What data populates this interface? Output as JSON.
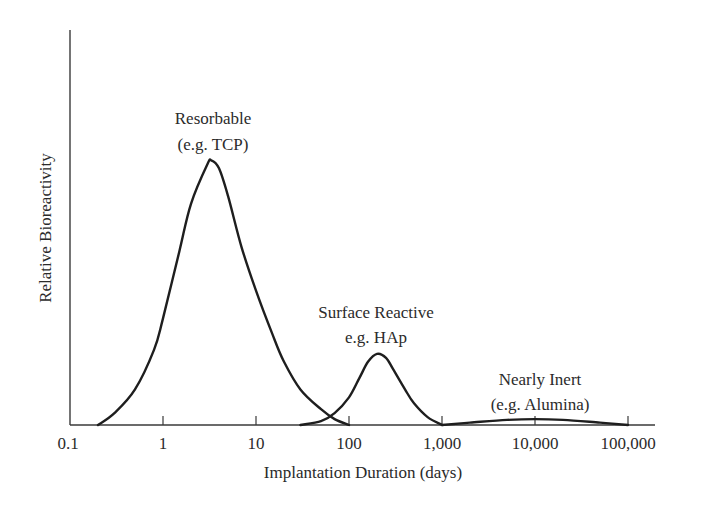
{
  "chart_data": {
    "type": "line",
    "title": "",
    "xlabel": "Implantation Duration (days)",
    "ylabel": "Relative Bioreactivity",
    "xscale": "log",
    "xlim": [
      0.1,
      100000
    ],
    "ylim": [
      0,
      100
    ],
    "grid": false,
    "legend": "none (curves annotated directly)",
    "x_ticks": [
      0.1,
      1,
      10,
      100,
      1000,
      10000,
      100000
    ],
    "x_tick_labels": [
      "0.1",
      "1",
      "10",
      "100",
      "1,000",
      "10,000",
      "100,000"
    ],
    "y_ticks": [],
    "series": [
      {
        "name": "Resorbable",
        "annotation": [
          "Resorbable",
          "(e.g. TCP)"
        ],
        "x": [
          0.2,
          0.3,
          0.5,
          0.8,
          1,
          1.5,
          2,
          3,
          3.3,
          4,
          5,
          7,
          10,
          15,
          20,
          30,
          50,
          70,
          100
        ],
        "values": [
          0,
          3,
          9,
          19,
          27,
          44,
          56,
          66,
          67,
          65,
          58,
          45,
          34,
          23,
          16,
          9,
          4,
          1.5,
          0
        ]
      },
      {
        "name": "Surface Reactive",
        "annotation": [
          "Surface Reactive",
          "e.g. HAp"
        ],
        "x": [
          30,
          50,
          70,
          100,
          130,
          160,
          200,
          250,
          300,
          400,
          500,
          700,
          1000
        ],
        "values": [
          0,
          1,
          3,
          7,
          12,
          16,
          18,
          17,
          14,
          9,
          5.5,
          2,
          0
        ]
      },
      {
        "name": "Nearly Inert",
        "annotation": [
          "Nearly Inert",
          "(e.g. Alumina)"
        ],
        "x": [
          1000,
          2000,
          5000,
          10000,
          20000,
          50000,
          100000
        ],
        "values": [
          0,
          0.6,
          1.3,
          1.5,
          1.3,
          0.6,
          0
        ]
      }
    ]
  },
  "axes": {
    "xlabel": "Implantation Duration (days)",
    "ylabel": "Relative Bioreactivity",
    "tick_labels": [
      "0.1",
      "1",
      "10",
      "100",
      "1,000",
      "10,000",
      "100,000"
    ]
  },
  "annotations": {
    "resorbable": {
      "line1": "Resorbable",
      "line2": "(e.g. TCP)"
    },
    "surface_reactive": {
      "line1": "Surface Reactive",
      "line2": "e.g. HAp"
    },
    "nearly_inert": {
      "line1": "Nearly Inert",
      "line2": "(e.g. Alumina)"
    }
  }
}
